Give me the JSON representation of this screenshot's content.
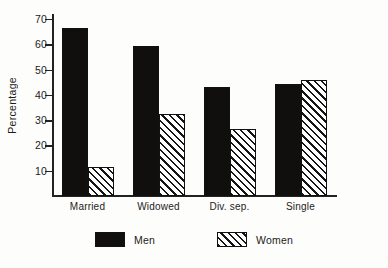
{
  "chart_data": {
    "type": "bar",
    "title": "",
    "xlabel": "",
    "ylabel": "Percentage",
    "ylim": [
      0,
      72
    ],
    "yticks": [
      10,
      20,
      30,
      40,
      50,
      60,
      70
    ],
    "grid": false,
    "legend_position": "bottom-center",
    "categories": [
      "Married",
      "Widowed",
      "Div. sep.",
      "Single"
    ],
    "series": [
      {
        "name": "Men",
        "values": [
          66.5,
          59.5,
          43.0,
          44.5
        ]
      },
      {
        "name": "Women",
        "values": [
          11.5,
          32.5,
          26.5,
          46.0
        ]
      }
    ]
  },
  "colors": {
    "men_fill": "#100f0d",
    "women_fill": "#ffffff",
    "hatch": "#151515",
    "axis": "#222222",
    "background": "#fdfdfb"
  }
}
